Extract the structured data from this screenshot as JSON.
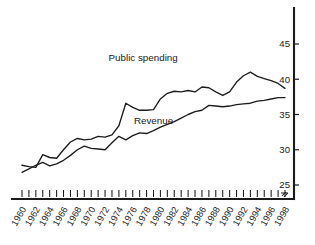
{
  "chart_data": {
    "type": "line",
    "title": "",
    "subtitle": "",
    "xlabel": "",
    "ylabel": "",
    "xlim": [
      1960,
      1998
    ],
    "ylim": [
      24.2,
      46.5
    ],
    "yticks": [
      25,
      30,
      35,
      40,
      45
    ],
    "ytick_labels": [
      "25",
      "30",
      "35",
      "40",
      "45"
    ],
    "y_axis_position": "right",
    "y_axis_break": true,
    "grid": false,
    "legend": "inline-annotations",
    "x": [
      1960,
      1961,
      1962,
      1963,
      1964,
      1965,
      1966,
      1967,
      1968,
      1969,
      1970,
      1971,
      1972,
      1973,
      1974,
      1975,
      1976,
      1977,
      1978,
      1979,
      1980,
      1981,
      1982,
      1983,
      1984,
      1985,
      1986,
      1987,
      1988,
      1989,
      1990,
      1991,
      1992,
      1993,
      1994,
      1995,
      1996,
      1997,
      1998
    ],
    "xtick_labels": [
      "1960",
      "1962",
      "1964",
      "1966",
      "1968",
      "1970",
      "1972",
      "1974",
      "1976",
      "1978",
      "1980",
      "1982",
      "1984",
      "1986",
      "1988",
      "1990",
      "1992",
      "1994",
      "1996",
      "1998"
    ],
    "xtick_step": 2,
    "minor_xticks_every_year": true,
    "series": [
      {
        "name": "Public spending",
        "label_x": 1977.5,
        "label_y": 42.6,
        "values": [
          27.8,
          27.6,
          27.5,
          29.3,
          28.9,
          28.8,
          30.0,
          31.1,
          31.6,
          31.4,
          31.5,
          31.9,
          31.8,
          32.1,
          33.4,
          36.6,
          36.0,
          35.6,
          35.6,
          35.7,
          37.2,
          38.0,
          38.3,
          38.2,
          38.4,
          38.2,
          38.9,
          38.8,
          38.2,
          37.7,
          38.2,
          39.6,
          40.5,
          41.0,
          40.4,
          40.1,
          39.8,
          39.4,
          38.7
        ]
      },
      {
        "name": "Revenue",
        "label_x": 1979.0,
        "label_y": 33.6,
        "values": [
          26.8,
          27.3,
          27.8,
          28.2,
          27.7,
          28.0,
          28.5,
          29.2,
          30.0,
          30.5,
          30.2,
          30.1,
          30.0,
          31.0,
          31.9,
          31.4,
          32.0,
          32.4,
          32.3,
          32.7,
          33.2,
          33.6,
          34.0,
          34.5,
          35.0,
          35.4,
          35.6,
          36.3,
          36.2,
          36.1,
          36.2,
          36.4,
          36.5,
          36.6,
          36.9,
          37.0,
          37.2,
          37.4,
          37.4
        ]
      }
    ]
  },
  "annotations": {
    "public_spending_label": "Public spending",
    "revenue_label": "Revenue"
  }
}
